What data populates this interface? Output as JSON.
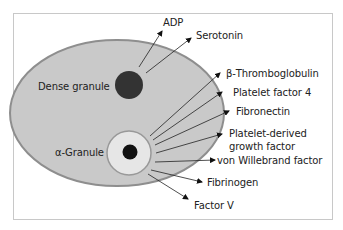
{
  "diagram": {
    "cell": {
      "name": "platelet",
      "fill": "#c9c9c9",
      "stroke": "#8e8e8e"
    },
    "granules": [
      {
        "label": "Dense granule",
        "fill": "#333333"
      },
      {
        "label": "α-Granule",
        "outer_fill": "#e6e6e6",
        "core_fill": "#111111"
      }
    ],
    "released": [
      {
        "label": "ADP",
        "from": "Dense granule"
      },
      {
        "label": "Serotonin",
        "from": "Dense granule"
      },
      {
        "label": "β-Thromboglobulin",
        "from": "α-Granule"
      },
      {
        "label": "Platelet factor 4",
        "from": "α-Granule"
      },
      {
        "label": "Fibronectin",
        "from": "α-Granule"
      },
      {
        "label": "Platelet-derived",
        "label2": "growth factor",
        "from": "α-Granule"
      },
      {
        "label": "von Willebrand factor",
        "from": "α-Granule"
      },
      {
        "label": "Fibrinogen",
        "from": "α-Granule"
      },
      {
        "label": "Factor V",
        "from": "α-Granule"
      }
    ]
  }
}
